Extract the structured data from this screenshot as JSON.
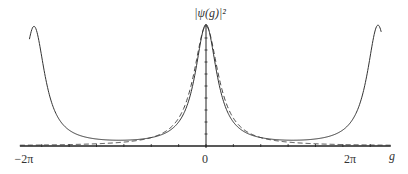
{
  "chart_data": {
    "type": "line",
    "title": "",
    "ylabel": "|ψ(g)|²",
    "xlabel": "g",
    "xlim": [
      -6.8,
      6.75
    ],
    "ylim": [
      0,
      1.0
    ],
    "grid": false,
    "legend": "none",
    "x_ticks": [
      {
        "value": -6.2832,
        "label": "−2π"
      },
      {
        "value": 0,
        "label": "0"
      },
      {
        "value": 6.2832,
        "label": "2π"
      }
    ],
    "series": [
      {
        "name": "exact",
        "style": "solid",
        "color": "#333333",
        "description": "Periodic peaks at g = -2π, 0, 2π",
        "peaks": [
          {
            "x": -6.2832,
            "y": 0.99
          },
          {
            "x": 0,
            "y": 1.0
          },
          {
            "x": 6.2832,
            "y": 1.0
          }
        ],
        "half_width": 0.48
      },
      {
        "name": "approximation",
        "style": "dashed",
        "color": "#333333",
        "description": "Single Lorentzian-like peak at g = 0",
        "peaks": [
          {
            "x": 0,
            "y": 1.0
          }
        ],
        "half_width": 0.55
      }
    ]
  }
}
